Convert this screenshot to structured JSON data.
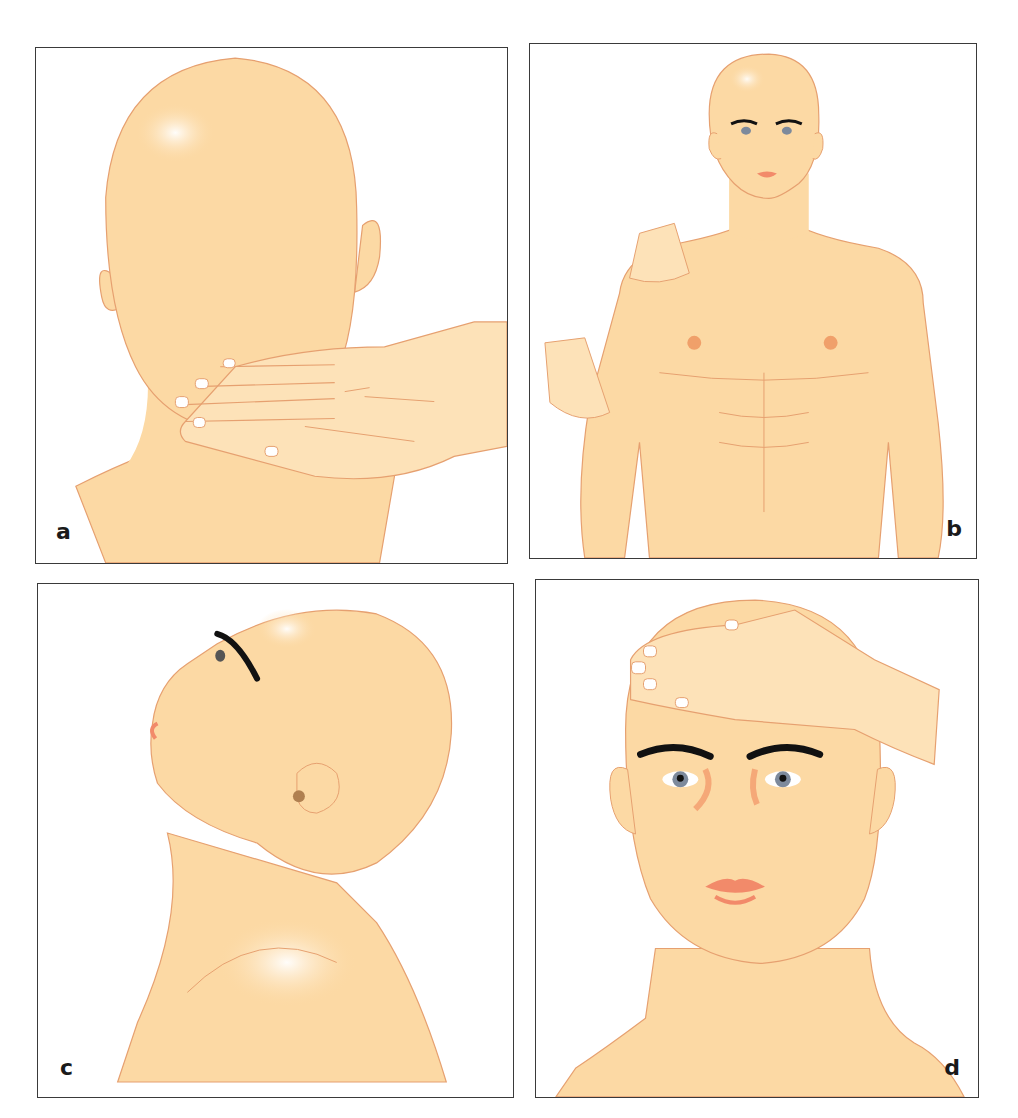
{
  "figure": {
    "panels": [
      {
        "id": "a",
        "label": "a",
        "description": "Posterior view of head; examiner's hand palpating the back of the neck"
      },
      {
        "id": "b",
        "label": "b",
        "description": "Anterior view of upper body; examiner's hands on right shoulder and right upper arm"
      },
      {
        "id": "c",
        "label": "c",
        "description": "Lateral view of head tilted back (neck extended)"
      },
      {
        "id": "d",
        "label": "d",
        "description": "Anterior view of face; examiner's hand resting on forehead"
      }
    ]
  },
  "colors": {
    "skin": "#fcd9a4",
    "skin_light": "#fde6c0",
    "outline": "#e6a070",
    "blush": "#f5a878",
    "lips": "#f28a6a",
    "nails": "#ffffff",
    "brows": "#111111",
    "iris": "#7d8a9c",
    "border": "#3a3a3a",
    "label": "#1a1a1a"
  }
}
